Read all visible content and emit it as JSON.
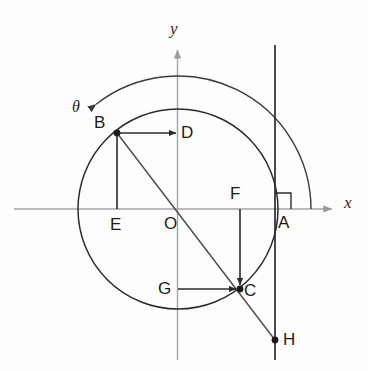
{
  "figure": {
    "type": "geometry-diagram",
    "background_color": "#fdfdfd",
    "stroke_color": "#2b2b2b",
    "axis_color": "#9a9a9a"
  },
  "axes": {
    "x_label": "x",
    "y_label": "y",
    "origin_label": "O",
    "x_axis": {
      "x1": 14,
      "y1": 209,
      "x2": 336,
      "y2": 209
    },
    "y_axis": {
      "x1": 177.5,
      "y1": 360,
      "x2": 177.5,
      "y2": 46
    },
    "x_label_pos": {
      "x": 344,
      "y": 200
    },
    "y_label_pos": {
      "x": 170,
      "y": 20
    },
    "origin_label_pos": {
      "x": 164,
      "y": 215
    }
  },
  "circle": {
    "center": {
      "x": 178,
      "y": 209
    },
    "radius": 100
  },
  "theta_arc": {
    "label": "θ",
    "label_pos": {
      "x": 72,
      "y": 99
    },
    "radius": 133,
    "start_angle_deg": 128,
    "end_angle_deg": 0,
    "arrow_at": "start"
  },
  "vertical_line": {
    "x": 275,
    "y_top": 45,
    "y_bottom": 360
  },
  "right_angle_marker": {
    "at": {
      "x": 275,
      "y": 209
    },
    "size": 16,
    "direction": "upper-right"
  },
  "points": [
    {
      "name": "B",
      "x": 117,
      "y": 133,
      "dot": true,
      "label": "B",
      "label_pos": {
        "x": 94,
        "y": 114
      }
    },
    {
      "name": "D",
      "x": 178,
      "y": 133,
      "dot": false,
      "label": "D",
      "label_pos": {
        "x": 181,
        "y": 124
      }
    },
    {
      "name": "E",
      "x": 117,
      "y": 209,
      "dot": false,
      "label": "E",
      "label_pos": {
        "x": 110,
        "y": 216
      }
    },
    {
      "name": "F",
      "x": 240,
      "y": 209,
      "dot": false,
      "label": "F",
      "label_pos": {
        "x": 230,
        "y": 185
      }
    },
    {
      "name": "G",
      "x": 178,
      "y": 289,
      "dot": false,
      "label": "G",
      "label_pos": {
        "x": 158,
        "y": 280
      }
    },
    {
      "name": "C",
      "x": 240,
      "y": 289,
      "dot": true,
      "label": "C",
      "label_pos": {
        "x": 244,
        "y": 282
      }
    },
    {
      "name": "A",
      "x": 275,
      "y": 209,
      "dot": false,
      "label": "A",
      "label_pos": {
        "x": 278,
        "y": 214
      }
    },
    {
      "name": "H",
      "x": 275,
      "y": 340,
      "dot": true,
      "label": "H",
      "label_pos": {
        "x": 283,
        "y": 331
      }
    }
  ],
  "segments": [
    {
      "name": "B-to-D",
      "from": {
        "x": 120,
        "y": 133
      },
      "to": {
        "x": 177,
        "y": 133
      },
      "arrow": true
    },
    {
      "name": "B-to-E",
      "from": {
        "x": 117,
        "y": 136
      },
      "to": {
        "x": 117,
        "y": 209
      },
      "arrow": false
    },
    {
      "name": "G-to-C",
      "from": {
        "x": 178,
        "y": 289
      },
      "to": {
        "x": 237,
        "y": 289
      },
      "arrow": true
    },
    {
      "name": "F-to-C",
      "from": {
        "x": 240,
        "y": 209
      },
      "to": {
        "x": 240,
        "y": 286
      },
      "arrow": true
    },
    {
      "name": "B-to-H-diagonal",
      "from": {
        "x": 117,
        "y": 133
      },
      "to": {
        "x": 275,
        "y": 340
      },
      "arrow": false
    }
  ]
}
